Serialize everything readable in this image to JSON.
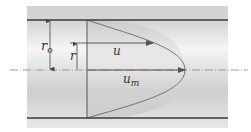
{
  "diagram": {
    "type": "laminar-pipe-flow-velocity-profile",
    "labels": {
      "r0_main": "r",
      "r0_sub": "o",
      "r": "r",
      "u": "u",
      "um_main": "u",
      "um_sub": "m"
    },
    "colors": {
      "pipe_fill_dark": "#d2d2d2",
      "pipe_fill_light": "#fafafa",
      "wall": "#3a3a3a",
      "profile_fill": "#c8c8c8",
      "lines": "#555555",
      "centerline": "#888888"
    }
  }
}
